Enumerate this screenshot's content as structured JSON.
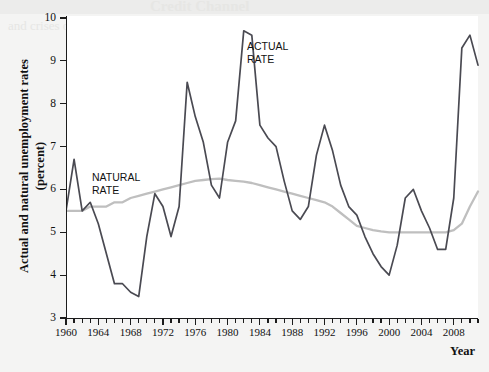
{
  "figure": {
    "y_axis_title": "Actual and natural unemployment rates (percent)",
    "x_axis_title": "Year"
  },
  "annotations": {
    "actual": "ACTUAL\nRATE",
    "natural": "NATURAL\nRATE"
  },
  "colors": {
    "actual_rate_line": "#4a4a52",
    "natural_rate_line": "#bfbfbf",
    "axis": "#1c1c1c",
    "plot_background": "#ffffff",
    "page_background": "#f2f2f0"
  },
  "chart_data": {
    "type": "line",
    "title": "",
    "xlabel": "Year",
    "ylabel": "Actual and natural unemployment rates (percent)",
    "xlim": [
      1960,
      2011
    ],
    "ylim": [
      3,
      10
    ],
    "ytick_values": [
      3,
      4,
      5,
      6,
      7,
      8,
      9,
      10
    ],
    "ytick_labels": [
      "3",
      "4",
      "5",
      "6",
      "7",
      "8",
      "9",
      "10"
    ],
    "xtick_major_values": [
      1960,
      1964,
      1968,
      1972,
      1976,
      1980,
      1984,
      1988,
      1992,
      1996,
      2000,
      2004,
      2008
    ],
    "xtick_major_labels": [
      "1960",
      "1964",
      "1968",
      "1972",
      "1976",
      "1980",
      "1984",
      "1988",
      "1992",
      "1996",
      "2000",
      "2004",
      "2008"
    ],
    "xtick_minor_step": 1,
    "grid": false,
    "legend_position": "inline-annotations",
    "x": [
      1960,
      1961,
      1962,
      1963,
      1964,
      1965,
      1966,
      1967,
      1968,
      1969,
      1970,
      1971,
      1972,
      1973,
      1974,
      1975,
      1976,
      1977,
      1978,
      1979,
      1980,
      1981,
      1982,
      1983,
      1984,
      1985,
      1986,
      1987,
      1988,
      1989,
      1990,
      1991,
      1992,
      1993,
      1994,
      1995,
      1996,
      1997,
      1998,
      1999,
      2000,
      2001,
      2002,
      2003,
      2004,
      2005,
      2006,
      2007,
      2008,
      2009,
      2010,
      2011
    ],
    "series": [
      {
        "name": "ACTUAL RATE",
        "color": "#4a4a52",
        "values": [
          5.5,
          6.7,
          5.5,
          5.7,
          5.2,
          4.5,
          3.8,
          3.8,
          3.6,
          3.5,
          4.9,
          5.9,
          5.6,
          4.9,
          5.6,
          8.5,
          7.7,
          7.1,
          6.1,
          5.8,
          7.1,
          7.6,
          9.7,
          9.6,
          7.5,
          7.2,
          7.0,
          6.2,
          5.5,
          5.3,
          5.6,
          6.8,
          7.5,
          6.9,
          6.1,
          5.6,
          5.4,
          4.9,
          4.5,
          4.2,
          4.0,
          4.7,
          5.8,
          6.0,
          5.5,
          5.1,
          4.6,
          4.6,
          5.8,
          9.3,
          9.6,
          8.9
        ]
      },
      {
        "name": "NATURAL RATE",
        "color": "#bfbfbf",
        "values": [
          5.5,
          5.5,
          5.5,
          5.6,
          5.6,
          5.6,
          5.7,
          5.7,
          5.8,
          5.85,
          5.9,
          5.95,
          6.0,
          6.05,
          6.1,
          6.15,
          6.2,
          6.22,
          6.24,
          6.25,
          6.22,
          6.2,
          6.18,
          6.15,
          6.1,
          6.05,
          6.0,
          5.95,
          5.9,
          5.85,
          5.8,
          5.75,
          5.7,
          5.6,
          5.45,
          5.3,
          5.15,
          5.1,
          5.05,
          5.02,
          5.0,
          5.0,
          5.0,
          5.0,
          5.0,
          5.0,
          5.0,
          5.0,
          5.05,
          5.2,
          5.6,
          5.95
        ]
      }
    ]
  }
}
